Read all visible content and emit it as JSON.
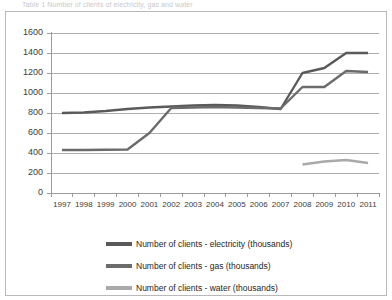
{
  "caption": {
    "partial_text": "Table 1 Number of clients of electricity, gas and water"
  },
  "colors": {
    "electricity": "#5a5a5a",
    "gas": "#6b6b6b",
    "water": "#a9a9a9",
    "grid": "#aeaeae",
    "axis": "#9a9a9a",
    "text": "#3b3b3b",
    "frame": "#b9b9b9",
    "background": "#ffffff"
  },
  "chart_data": {
    "type": "line",
    "title": "",
    "xlabel": "",
    "ylabel": "",
    "ylim": [
      0,
      1600
    ],
    "ytick_step": 200,
    "yticks": [
      0,
      200,
      400,
      600,
      800,
      1000,
      1200,
      1400,
      1600
    ],
    "grid": true,
    "legend_position": "bottom",
    "categories": [
      "1997",
      "1998",
      "1999",
      "2000",
      "2001",
      "2002",
      "2003",
      "2004",
      "2005",
      "2006",
      "2007",
      "2008",
      "2009",
      "2010",
      "2011"
    ],
    "series": [
      {
        "name": "Number of clients - electricity (thousands)",
        "short": "electricity",
        "color": "#5a5a5a",
        "values": [
          800,
          805,
          820,
          840,
          855,
          865,
          875,
          880,
          875,
          860,
          840,
          1200,
          1250,
          1400,
          1400
        ]
      },
      {
        "name": "Number of clients - gas (thousands)",
        "short": "gas",
        "color": "#6b6b6b",
        "values": [
          430,
          430,
          432,
          435,
          600,
          850,
          855,
          860,
          855,
          850,
          845,
          1060,
          1060,
          1220,
          1210
        ]
      },
      {
        "name": "Number of clients - water (thousands)",
        "short": "water",
        "color": "#a9a9a9",
        "values": [
          null,
          null,
          null,
          null,
          null,
          null,
          null,
          null,
          null,
          null,
          null,
          285,
          315,
          330,
          300
        ]
      }
    ]
  },
  "legend": {
    "entries": [
      {
        "label": "Number of clients - electricity (thousands)",
        "color": "#5a5a5a"
      },
      {
        "label": "Number of clients - gas (thousands)",
        "color": "#6b6b6b"
      },
      {
        "label": "Number of clients - water (thousands)",
        "color": "#a9a9a9"
      }
    ]
  }
}
